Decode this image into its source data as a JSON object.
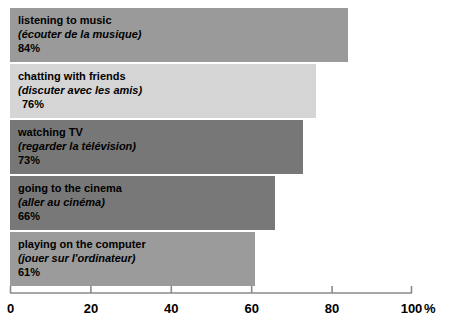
{
  "chart_data": {
    "type": "bar",
    "orientation": "horizontal",
    "title": "",
    "xlabel": "%",
    "ylabel": "",
    "xlim": [
      0,
      100
    ],
    "xticks": [
      0,
      20,
      40,
      60,
      80,
      100
    ],
    "grid": false,
    "legend": "none",
    "categories": [
      "listening to music",
      "chatting with friends",
      "watching TV",
      "going to the cinema",
      "playing on the computer"
    ],
    "categories_fr": [
      "(écouter de la musique)",
      "(discuter avec les amis)",
      "(regarder la télévision)",
      "(aller au cinéma)",
      "(jouer sur l'ordinateur)"
    ],
    "values": [
      84,
      76,
      73,
      66,
      61
    ],
    "value_labels": [
      "84%",
      "76%",
      "73%",
      "66%",
      "61%"
    ],
    "bar_colors": [
      "#9a9a9a",
      "#d5d5d5",
      "#777777",
      "#787878",
      "#9b9b9b"
    ]
  },
  "axis": {
    "unit_label": "%",
    "tick_labels": [
      "0",
      "20",
      "40",
      "60",
      "80",
      "100"
    ],
    "line_color": "#8a8a8a"
  },
  "bars": [
    {
      "label_en": "listening to music",
      "label_fr": "(écouter de la musique)",
      "value_label": "84%",
      "value": 84,
      "color": "#9a9a9a",
      "value_indent": false
    },
    {
      "label_en": "chatting with friends",
      "label_fr": "(discuter avec les amis)",
      "value_label": "76%",
      "value": 76,
      "color": "#d5d5d5",
      "value_indent": true
    },
    {
      "label_en": "watching TV",
      "label_fr": "(regarder la télévision)",
      "value_label": "73%",
      "value": 73,
      "color": "#777777",
      "value_indent": false
    },
    {
      "label_en": "going to the cinema",
      "label_fr": "(aller au cinéma)",
      "value_label": "66%",
      "value": 66,
      "color": "#787878",
      "value_indent": false
    },
    {
      "label_en": "playing on the computer",
      "label_fr": "(jouer sur l'ordinateur)",
      "value_label": "61%",
      "value": 61,
      "color": "#9b9b9b",
      "value_indent": false
    }
  ]
}
